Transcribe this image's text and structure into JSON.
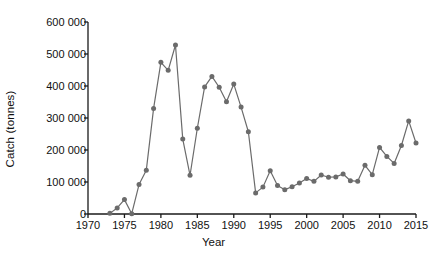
{
  "chart_data": {
    "type": "line",
    "title": "",
    "subtitle": "",
    "xlabel": "Year",
    "ylabel": "Catch (tonnes)",
    "xlim": [
      1970,
      2015
    ],
    "ylim": [
      0,
      600000
    ],
    "grid": false,
    "legend": "none",
    "marker": "filled-circle",
    "series_color": "#6b6b6b",
    "axis_color": "#1a1a1a",
    "xticks": [
      1970,
      1975,
      1980,
      1985,
      1990,
      1995,
      2000,
      2005,
      2010,
      2015
    ],
    "xtick_labels": [
      "1970",
      "1975",
      "1980",
      "1985",
      "1990",
      "1995",
      "2000",
      "2005",
      "2010",
      "2015"
    ],
    "yticks": [
      0,
      100000,
      200000,
      300000,
      400000,
      500000,
      600000
    ],
    "ytick_labels": [
      "0",
      "100 000",
      "200 000",
      "300 000",
      "400 000",
      "500 000",
      "600 000"
    ],
    "x": [
      1973,
      1974,
      1975,
      1976,
      1977,
      1978,
      1979,
      1980,
      1981,
      1982,
      1983,
      1984,
      1985,
      1986,
      1987,
      1988,
      1989,
      1990,
      1991,
      1992,
      1993,
      1994,
      1995,
      1996,
      1997,
      1998,
      1999,
      2000,
      2001,
      2002,
      2003,
      2004,
      2005,
      2006,
      2007,
      2008,
      2009,
      2010,
      2011,
      2012,
      2013,
      2014,
      2015
    ],
    "values": [
      2000,
      19000,
      45000,
      1000,
      92000,
      137000,
      330000,
      474000,
      449000,
      528000,
      234000,
      121000,
      268000,
      397000,
      430000,
      396000,
      351000,
      406000,
      334000,
      257000,
      66000,
      84000,
      135000,
      89000,
      76000,
      85000,
      97000,
      111000,
      102000,
      122000,
      115000,
      116000,
      125000,
      104000,
      102000,
      152000,
      123000,
      208000,
      180000,
      158000,
      214000,
      291000,
      222000
    ],
    "annotations": []
  }
}
